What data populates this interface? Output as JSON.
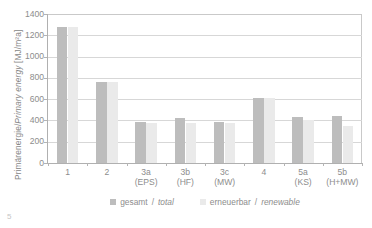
{
  "figure": {
    "number": "5"
  },
  "legend": [
    {
      "key": "total",
      "label_de": "gesamt",
      "label_en": "total",
      "sep": "/",
      "color": "#bdbdbd"
    },
    {
      "key": "renewable",
      "label_de": "erneuerbar",
      "label_en": "renewable",
      "sep": "/",
      "color": "#eaeaea"
    }
  ],
  "chart_data": {
    "type": "bar",
    "title": "",
    "xlabel": "",
    "ylabel": "Primärenergie/Primary energy [MJ/m²a]",
    "ylabel_de": "Primärenergie",
    "ylabel_en": "Primary energy",
    "yunit": "[MJ/m²a]",
    "ylim": [
      0,
      1400
    ],
    "yticks": [
      0,
      200,
      400,
      600,
      800,
      1000,
      1200,
      1400
    ],
    "ytick_labels": [
      "0",
      "200",
      "400",
      "600",
      "800",
      "1000",
      "1200",
      "1400"
    ],
    "grid": "horizontal",
    "legend_position": "bottom-center",
    "categories": [
      "1",
      "2",
      "3a",
      "3b",
      "3c",
      "4",
      "5a",
      "5b"
    ],
    "category_sublabels": [
      "",
      "",
      "(EPS)",
      "(HF)",
      "(MW)",
      "",
      "(KS)",
      "(H+MW)"
    ],
    "series": [
      {
        "name": "gesamt/total",
        "color": "#bdbdbd",
        "values": [
          1280,
          765,
          385,
          420,
          390,
          615,
          435,
          445
        ]
      },
      {
        "name": "erneuerbar/renewable",
        "color": "#eaeaea",
        "values": [
          1280,
          760,
          375,
          380,
          380,
          612,
          400,
          350
        ]
      }
    ]
  }
}
